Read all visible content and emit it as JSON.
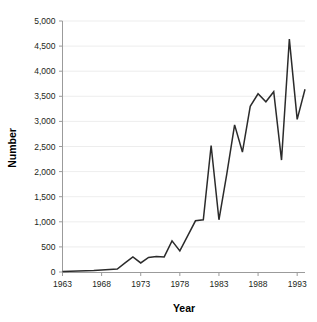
{
  "chart_data": {
    "type": "line",
    "title": "",
    "xlabel": "Year",
    "ylabel": "Number",
    "xlim": [
      1963,
      1994
    ],
    "ylim": [
      0,
      5000
    ],
    "grid": true,
    "legend": "none",
    "series_color": "#2b2b2b",
    "x_tick_labels": [
      "1963",
      "1968",
      "1973",
      "1978",
      "1983",
      "1988",
      "1993"
    ],
    "x_ticks": [
      1963,
      1968,
      1973,
      1978,
      1983,
      1988,
      1993
    ],
    "y_tick_labels": [
      "0",
      "500",
      "1,000",
      "1,500",
      "2,000",
      "2,500",
      "3,000",
      "3,500",
      "4,000",
      "4,500",
      "5,000"
    ],
    "y_ticks": [
      0,
      500,
      1000,
      1500,
      2000,
      2500,
      3000,
      3500,
      4000,
      4500,
      5000
    ],
    "x": [
      1963,
      1964,
      1965,
      1966,
      1967,
      1968,
      1969,
      1970,
      1971,
      1972,
      1973,
      1974,
      1975,
      1976,
      1977,
      1978,
      1979,
      1980,
      1981,
      1982,
      1983,
      1984,
      1985,
      1986,
      1987,
      1988,
      1989,
      1990,
      1991,
      1992,
      1993,
      1994
    ],
    "values": [
      10,
      15,
      20,
      25,
      30,
      40,
      50,
      60,
      180,
      300,
      180,
      290,
      310,
      300,
      620,
      420,
      720,
      1020,
      1040,
      2520,
      1040,
      1950,
      2930,
      2390,
      3300,
      3550,
      3390,
      3590,
      2230,
      4640,
      3040,
      3640
    ],
    "series": [
      {
        "name": "Number",
        "values": [
          10,
          15,
          20,
          25,
          30,
          40,
          50,
          60,
          180,
          300,
          180,
          290,
          310,
          300,
          620,
          420,
          720,
          1020,
          1040,
          2520,
          1040,
          1950,
          2930,
          2390,
          3300,
          3550,
          3390,
          3590,
          2230,
          4640,
          3040,
          3640
        ]
      }
    ]
  }
}
